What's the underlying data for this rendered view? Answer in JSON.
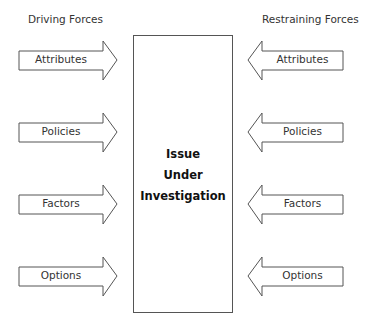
{
  "diagram": {
    "type": "force-field-analysis",
    "left_header": "Driving Forces",
    "right_header": "Restraining Forces",
    "center": {
      "line1": "Issue",
      "line2": "Under",
      "line3": "Investigation"
    },
    "driving_forces": [
      {
        "label": "Attributes"
      },
      {
        "label": "Policies"
      },
      {
        "label": "Factors"
      },
      {
        "label": "Options"
      }
    ],
    "restraining_forces": [
      {
        "label": "Attributes"
      },
      {
        "label": "Policies"
      },
      {
        "label": "Factors"
      },
      {
        "label": "Options"
      }
    ],
    "colors": {
      "stroke": "#555555",
      "text": "#333333",
      "background": "#ffffff"
    }
  }
}
